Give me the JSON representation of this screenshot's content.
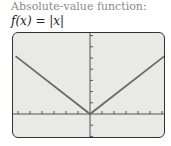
{
  "caption": "Absolute-value function:",
  "formula": "f(x) = |x|",
  "colors": {
    "screen_bg": "#e9e9e6",
    "frame": "#333333",
    "axis": "#555555",
    "curve": "#6b6b6b"
  },
  "chart_data": {
    "type": "line",
    "title": "f(x) = |x|",
    "function": "absolute value",
    "series": [
      {
        "name": "f(x) = |x|",
        "x": [
          -6,
          0,
          6
        ],
        "y": [
          5,
          0,
          5
        ]
      }
    ],
    "xlim": [
      -6.2,
      6.2
    ],
    "ylim": [
      -2,
      7
    ],
    "x_ticks_count_each_side": 6,
    "y_ticks_above": 7,
    "y_ticks_below": 2,
    "grid": false,
    "legend": "none"
  }
}
